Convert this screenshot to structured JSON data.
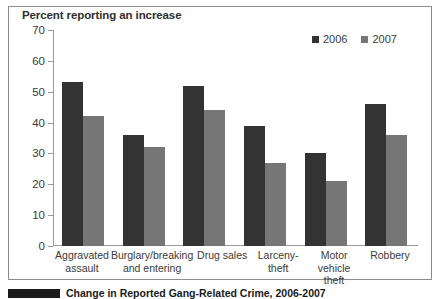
{
  "chart_data": {
    "type": "bar",
    "title": "Percent reporting an increase",
    "xlabel": "",
    "ylabel": "",
    "ylim": [
      0,
      70
    ],
    "yticks": [
      0,
      10,
      20,
      30,
      40,
      50,
      60,
      70
    ],
    "grid": false,
    "legend_position": "top-right",
    "categories": [
      "Aggravated assault",
      "Burglary/breaking and entering",
      "Drug sales",
      "Larceny-theft",
      "Motor vehicle theft",
      "Robbery"
    ],
    "series": [
      {
        "name": "2006",
        "color": "#333333",
        "values": [
          53,
          36,
          52,
          39,
          30,
          46
        ]
      },
      {
        "name": "2007",
        "color": "#767676",
        "values": [
          42,
          32,
          44,
          27,
          21,
          36
        ]
      }
    ]
  },
  "caption": {
    "text": "Change in Reported Gang-Related Crime, 2006-2007"
  }
}
